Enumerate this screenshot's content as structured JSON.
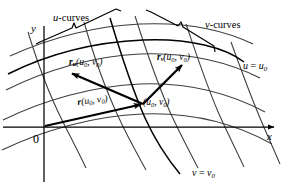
{
  "figure": {
    "kind": "parametric-surface-tangent-vectors-diagram",
    "background_color": "#ffffff",
    "ink_color": "#000000",
    "grid_curve_color": "#3a3a3a",
    "width": 285,
    "height": 186
  },
  "labels": {
    "u_curves": "u-curves",
    "v_curves": "v-curves",
    "y_axis": "y",
    "x_axis": "x",
    "origin": "0",
    "vector_ru": {
      "base": "r",
      "sub": "u",
      "args": "(u",
      "args_sub": "0",
      "args_mid": ", v",
      "args_sub2": "0",
      "args_end": ")"
    },
    "vector_rv": {
      "base": "r",
      "sub": "v"
    },
    "vector_r": {
      "base": "r"
    },
    "point": "(u₀, v₀)",
    "u_constant": "u = u₀",
    "v_constant": "v = v₀",
    "ru_full": "rᵤ(u₀, v₀)",
    "rv_full": "rᵥ(u₀, v₀)",
    "r_full": "r(u₀, v₀)"
  },
  "axes": {
    "origin_px": [
      44,
      127
    ],
    "x_axis": {
      "from": [
        3,
        127
      ],
      "to": [
        278,
        127
      ]
    },
    "y_axis": {
      "from": [
        44,
        25
      ],
      "to": [
        44,
        182
      ]
    }
  },
  "vectors": [
    {
      "name": "position-vector-r",
      "label": "r(u₀, v₀)",
      "from": [
        44,
        127
      ],
      "to": [
        143,
        104
      ],
      "style": "thick-arrow"
    },
    {
      "name": "tangent-vector-ru",
      "label": "rᵤ(u₀, v₀)",
      "from": [
        143,
        104
      ],
      "to": [
        69,
        72
      ],
      "style": "thick-arrow"
    },
    {
      "name": "tangent-vector-rv",
      "label": "rᵥ(u₀, v₀)",
      "from": [
        143,
        104
      ],
      "to": [
        184,
        63
      ],
      "style": "thick-arrow"
    }
  ],
  "curves": {
    "u_family_count": 4,
    "v_family_count": 5,
    "highlighted_u_curve": "u = u₀",
    "highlighted_v_curve": "v = v₀",
    "point_of_tangency": [
      143,
      104
    ]
  }
}
